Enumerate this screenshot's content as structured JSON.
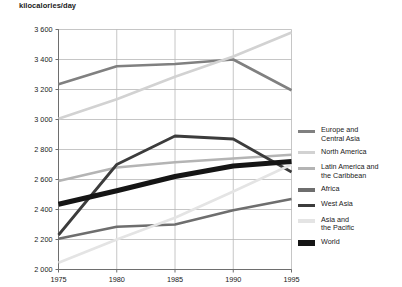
{
  "chart_data": {
    "type": "line",
    "title": "kilocalories/day",
    "xlabel": "",
    "ylabel": "kilocalories/day",
    "x": [
      1975,
      1980,
      1985,
      1990,
      1995
    ],
    "xtick_labels": [
      "1975",
      "1980",
      "1985",
      "1990",
      "1995"
    ],
    "xlim": [
      1975,
      1995
    ],
    "ylim": [
      2000,
      3600
    ],
    "yticks": [
      2000,
      2200,
      2400,
      2600,
      2800,
      3000,
      3200,
      3400,
      3600
    ],
    "ytick_labels": [
      "2 000",
      "2 200",
      "2 400",
      "2 600",
      "2 800",
      "3 000",
      "3 200",
      "3 400",
      "3 600"
    ],
    "grid": true,
    "legend_position": "right",
    "series": [
      {
        "name": "Europe and\nCentral Asia",
        "legend_label": "Europe and\nCentral Asia",
        "color": "#808080",
        "width": 2.6,
        "values": [
          3235,
          3355,
          3370,
          3400,
          3195
        ]
      },
      {
        "name": "North America",
        "legend_label": "North America",
        "color": "#d2d2d2",
        "width": 2.6,
        "values": [
          3005,
          3135,
          3285,
          3420,
          3580
        ]
      },
      {
        "name": "Latin America and\nthe Caribbean",
        "legend_label": "Latin America and\nthe Caribbean",
        "color": "#b4b4b4",
        "width": 2.6,
        "values": [
          2590,
          2680,
          2715,
          2740,
          2765
        ]
      },
      {
        "name": "Africa",
        "legend_label": "Africa",
        "color": "#6e6e6e",
        "width": 2.6,
        "values": [
          2205,
          2285,
          2300,
          2395,
          2470
        ]
      },
      {
        "name": "West Asia",
        "legend_label": "West Asia",
        "color": "#3c3c3c",
        "width": 2.8,
        "values": [
          2230,
          2700,
          2890,
          2870,
          2650
        ]
      },
      {
        "name": "Asia and\nthe Pacific",
        "legend_label": "Asia and\nthe Pacific",
        "color": "#e4e4e4",
        "width": 2.6,
        "values": [
          2045,
          2200,
          2345,
          2520,
          2700
        ]
      },
      {
        "name": "World",
        "legend_label": "World",
        "color": "#151515",
        "width": 5.2,
        "values": [
          2435,
          2525,
          2620,
          2690,
          2720
        ]
      }
    ]
  }
}
